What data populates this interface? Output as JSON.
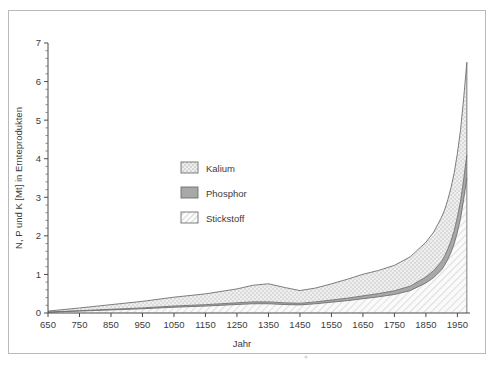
{
  "chart_data": {
    "type": "area",
    "stacked": true,
    "title": "",
    "xlabel": "Jahr",
    "ylabel": "N, P und K [Mt] in Ernteprodukten",
    "xlim": [
      650,
      1990
    ],
    "ylim": [
      0,
      7
    ],
    "xticks": [
      650,
      750,
      850,
      950,
      1050,
      1150,
      1250,
      1350,
      1450,
      1550,
      1650,
      1750,
      1850,
      1950
    ],
    "xtick_labels": [
      "650",
      "750",
      "850",
      "950",
      "1050",
      "1150",
      "1250",
      "1350",
      "1450",
      "1550",
      "1650",
      "1750",
      "1850",
      "1950"
    ],
    "yticks": [
      0,
      1,
      2,
      3,
      4,
      5,
      6,
      7
    ],
    "ytick_labels": [
      "0",
      "1",
      "2",
      "3",
      "4",
      "5",
      "6",
      "7"
    ],
    "y_minor_step": 0.2,
    "grid": false,
    "legend_position": "center-left-inside",
    "x": [
      650,
      750,
      850,
      950,
      1050,
      1150,
      1250,
      1300,
      1350,
      1400,
      1450,
      1500,
      1550,
      1600,
      1650,
      1700,
      1750,
      1800,
      1850,
      1875,
      1900,
      1910,
      1920,
      1930,
      1940,
      1950,
      1960,
      1970,
      1980
    ],
    "series": [
      {
        "name": "Stickstoff",
        "pattern": "diagonal-hatch",
        "color": "#f2f2f2",
        "values": [
          0.02,
          0.05,
          0.08,
          0.11,
          0.15,
          0.18,
          0.22,
          0.24,
          0.24,
          0.22,
          0.21,
          0.24,
          0.28,
          0.32,
          0.37,
          0.42,
          0.48,
          0.58,
          0.78,
          0.92,
          1.12,
          1.25,
          1.4,
          1.58,
          1.8,
          2.1,
          2.45,
          2.95,
          3.5
        ]
      },
      {
        "name": "Phosphor",
        "pattern": "solid-gray",
        "color": "#a8a8a8",
        "values": [
          0.004,
          0.01,
          0.016,
          0.022,
          0.03,
          0.036,
          0.044,
          0.048,
          0.048,
          0.044,
          0.042,
          0.048,
          0.056,
          0.064,
          0.074,
          0.084,
          0.096,
          0.115,
          0.155,
          0.18,
          0.22,
          0.24,
          0.27,
          0.3,
          0.34,
          0.39,
          0.45,
          0.52,
          0.6
        ]
      },
      {
        "name": "Kalium",
        "pattern": "stipple-dotted",
        "color": "#e6e6e6",
        "values": [
          0.026,
          0.07,
          0.12,
          0.17,
          0.23,
          0.28,
          0.36,
          0.43,
          0.47,
          0.4,
          0.33,
          0.36,
          0.42,
          0.49,
          0.56,
          0.6,
          0.66,
          0.76,
          0.9,
          1.0,
          1.15,
          1.2,
          1.28,
          1.38,
          1.5,
          1.65,
          1.85,
          2.1,
          2.4
        ]
      }
    ],
    "series_totals": [
      0.05,
      0.13,
      0.22,
      0.3,
      0.41,
      0.5,
      0.62,
      0.72,
      0.76,
      0.66,
      0.58,
      0.65,
      0.76,
      0.87,
      1.0,
      1.1,
      1.24,
      1.46,
      1.84,
      2.1,
      2.49,
      2.69,
      2.95,
      3.26,
      3.64,
      4.14,
      4.75,
      5.57,
      6.5
    ],
    "annotations": [
      {
        "text": "Peak near 1350 then decline to ~1450",
        "x": 1350,
        "y": 0.76
      },
      {
        "text": "Steep rise after 1850 to maximum ~6.5",
        "x": 1980,
        "y": 6.5
      }
    ]
  },
  "legend": {
    "items": [
      {
        "label": "Kalium",
        "pattern": "stipple-dotted"
      },
      {
        "label": "Phosphor",
        "pattern": "solid-gray"
      },
      {
        "label": "Stickstoff",
        "pattern": "diagonal-hatch"
      }
    ]
  },
  "axes": {
    "y_title": "N, P und K [Mt] in Ernteprodukten",
    "x_title": "Jahr"
  },
  "colors": {
    "kalium": "#e6e6e6",
    "phosphor": "#a8a8a8",
    "stickstoff": "#f2f2f2",
    "outline": "#6f6f6f",
    "axis": "#4a4a4a",
    "text": "#3b3b3b",
    "frame": "#b9b9b9"
  }
}
